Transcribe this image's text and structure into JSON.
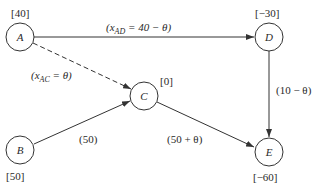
{
  "nodes": {
    "A": {
      "label": "A",
      "supply": "[40]"
    },
    "B": {
      "label": "B",
      "supply": "[50]"
    },
    "C": {
      "label": "C",
      "supply": "[0]"
    },
    "D": {
      "label": "D",
      "supply": "[−30]"
    },
    "E": {
      "label": "E",
      "supply": "[−60]"
    }
  },
  "edges": {
    "AD": {
      "label": "(x",
      "sub": "AD",
      "rest": " = 40 − θ)",
      "style": "solid"
    },
    "AC": {
      "label": "(x",
      "sub": "AC",
      "rest": " = θ)",
      "style": "dashed"
    },
    "BC": {
      "label": "(50)",
      "style": "solid"
    },
    "CE": {
      "label": "(50 + θ)",
      "style": "solid"
    },
    "DE": {
      "label": "(10 − θ)",
      "style": "solid"
    }
  },
  "colors": {
    "stroke": "#333333",
    "background": "#ffffff"
  }
}
